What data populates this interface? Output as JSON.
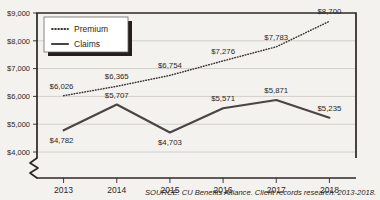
{
  "chart_data": {
    "type": "line",
    "title": "",
    "xlabel": "",
    "ylabel": "",
    "categories": [
      "2013",
      "2014",
      "2015",
      "2016",
      "2017",
      "2018"
    ],
    "series": [
      {
        "name": "Premium",
        "style": "dotted",
        "color": "#3b3633",
        "values": [
          6026,
          6365,
          6754,
          7276,
          7783,
          8700
        ],
        "labels": [
          "$6,026",
          "$6,365",
          "$6,754",
          "$7,276",
          "$7,783",
          "$8,700"
        ]
      },
      {
        "name": "Claims",
        "style": "solid",
        "color": "#4a4542",
        "values": [
          4782,
          5707,
          4703,
          5571,
          5871,
          5235
        ],
        "labels": [
          "$4,782",
          "$5,707",
          "$4,703",
          "$5,571",
          "$5,871",
          "$5,235"
        ]
      }
    ],
    "ylim": [
      4000,
      9000
    ],
    "yticks": [
      4000,
      5000,
      6000,
      7000,
      8000,
      9000
    ],
    "ytick_labels": [
      "$4,000",
      "$5,000",
      "$6,000",
      "$7,000",
      "$8,000",
      "$9,000"
    ],
    "grid": true,
    "axis_break": true,
    "legend_position": "top-left",
    "legend_entries": [
      "Premium",
      "Claims"
    ]
  },
  "source": {
    "caption": "SOURCE: CU Benefits Alliance. Client records research: 2013-2018."
  },
  "colors": {
    "background": "#f4f2ee",
    "axis": "#2b2724",
    "grid": "#c9c6c1",
    "premium": "#3b3633",
    "claims": "#4a4542",
    "legend_bg": "#ffffff",
    "legend_shadow": "#241f1d"
  }
}
